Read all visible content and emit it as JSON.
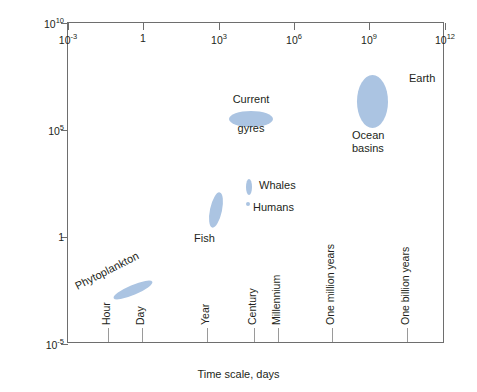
{
  "chart_data": {
    "type": "scatter",
    "title": "",
    "xlabel": "Time scale, days",
    "ylabel": "Size scale, meters",
    "xlim": [
      -3,
      12
    ],
    "ylim": [
      -5,
      10
    ],
    "xscale": "log",
    "yscale": "log",
    "grid": false,
    "legend": "none",
    "xticks": [
      {
        "value": -3,
        "label": "10",
        "exp": "-3"
      },
      {
        "value": 0,
        "label": "1",
        "exp": ""
      },
      {
        "value": 3,
        "label": "10",
        "exp": "3"
      },
      {
        "value": 6,
        "label": "10",
        "exp": "6"
      },
      {
        "value": 9,
        "label": "10",
        "exp": "9"
      },
      {
        "value": 12,
        "label": "10",
        "exp": "12"
      }
    ],
    "yticks": [
      {
        "value": -5,
        "label": "10",
        "exp": "-5"
      },
      {
        "value": 0,
        "label": "1",
        "exp": ""
      },
      {
        "value": 5,
        "label": "10",
        "exp": "5"
      },
      {
        "value": 10,
        "label": "10",
        "exp": "10"
      }
    ],
    "time_markers": [
      {
        "name": "Hour",
        "label": "Hour",
        "x": 1.6,
        "tick_h": 14
      },
      {
        "name": "Day",
        "label": "Day",
        "x": 2.95,
        "tick_h": 14
      },
      {
        "name": "Year",
        "label": "Year",
        "x": 5.55,
        "tick_h": 14
      },
      {
        "name": "Century",
        "label": "Century",
        "x": 7.4,
        "tick_h": 14
      },
      {
        "name": "Millennium",
        "label": "Millennium",
        "x": 8.36,
        "tick_h": 14
      },
      {
        "name": "One million years",
        "label": "One million years",
        "x": 10.5,
        "tick_h": 14
      },
      {
        "name": "One billion years",
        "label": "One billion years",
        "x": 13.5,
        "tick_h": 14
      }
    ],
    "blobs": [
      {
        "name": "phytoplankton",
        "label": "Phytoplankton",
        "x_days": 0.2,
        "y_meters": -4.6,
        "left": 111,
        "top": 284,
        "width": 42,
        "height": 10,
        "rotate": -23,
        "label_left": 72,
        "label_top": 280,
        "label_rotate": -27,
        "label_align": "left"
      },
      {
        "name": "fish",
        "label": "Fish",
        "x_days": 2.3,
        "y_meters": 0.3,
        "left": 209,
        "top": 191,
        "width": 12,
        "height": 36,
        "rotate": 12,
        "label_left": 193,
        "label_top": 231,
        "label_rotate": 0,
        "label_align": "left"
      },
      {
        "name": "humans",
        "label": "Humans",
        "x_days": 4.4,
        "y_meters": 0.25,
        "left": 245,
        "top": 201,
        "width": 4,
        "height": 4,
        "rotate": 0,
        "label_left": 252,
        "label_top": 200,
        "label_rotate": 0,
        "label_align": "left"
      },
      {
        "name": "whales",
        "label": "Whales",
        "x_days": 4.5,
        "y_meters": 1.1,
        "left": 245,
        "top": 178,
        "width": 6,
        "height": 16,
        "rotate": 0,
        "label_left": 258,
        "label_top": 178,
        "label_rotate": 0,
        "label_align": "left"
      },
      {
        "name": "current-gyres",
        "label": "Current\ngyres",
        "label_line1": "Current",
        "label_line2": "gyres",
        "x_days": 5.0,
        "y_meters": 5.0,
        "left": 228,
        "top": 110,
        "width": 44,
        "height": 16,
        "rotate": 0,
        "label_left": 226,
        "label_top": 92,
        "label_rotate": 0,
        "label_align": "center"
      },
      {
        "name": "ocean-basins",
        "label": "Ocean\nbasins",
        "label_line1": "Ocean",
        "label_line2": "basins",
        "x_days": 9.3,
        "y_meters": 6.2,
        "left": 356,
        "top": 74,
        "width": 31,
        "height": 53,
        "rotate": 0,
        "label_left": 351,
        "label_top": 128,
        "label_rotate": 0,
        "label_align": "left"
      },
      {
        "name": "earth",
        "label": "Earth",
        "x_days": 10.6,
        "y_meters": 7.0,
        "left": 0,
        "top": 0,
        "width": 0,
        "height": 0,
        "rotate": 0,
        "label_left": 408,
        "label_top": 71,
        "label_rotate": 0,
        "label_align": "left"
      }
    ],
    "colors": {
      "blob_fill": "#abc4e2",
      "axis": "#6e6e6e",
      "text": "#231f20",
      "background": "#ffffff"
    }
  },
  "axes": {
    "x_title": "Time scale, days",
    "y_title": "Size scale, meters"
  }
}
